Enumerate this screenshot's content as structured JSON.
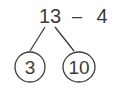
{
  "expression": {
    "minuend": "13",
    "operator": "–",
    "subtrahend": "4"
  },
  "bond": {
    "left": "3",
    "right": "10"
  },
  "colors": {
    "ink": "#3a3a3a",
    "background": "#ffffff"
  }
}
